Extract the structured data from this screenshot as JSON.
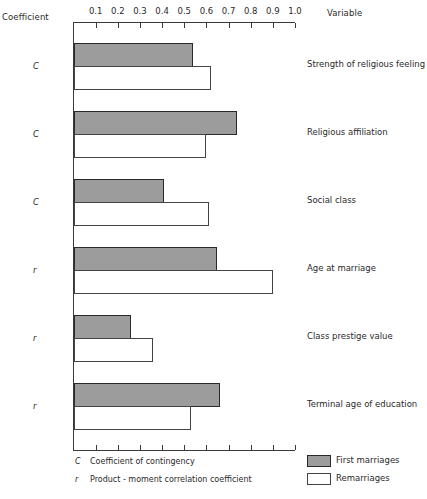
{
  "chart_data": {
    "type": "bar",
    "orientation": "horizontal",
    "title": "",
    "xlabel": "",
    "ylabel": "",
    "column_headers": {
      "left": "Coefficient",
      "right": "Variable"
    },
    "axis": {
      "min": 0,
      "max": 1.0,
      "ticks": [
        "0.1",
        "0.2",
        "0.3",
        "0.4",
        "0.5",
        "0.6",
        "0.7",
        "0.8",
        "0.9",
        "1.0"
      ],
      "position": "top and bottom"
    },
    "grid": false,
    "categories": [
      "Strength of religious feeling",
      "Religious affiliation",
      "Social class",
      "Age at marriage",
      "Class prestige value",
      "Terminal age of education"
    ],
    "coefficients": [
      "C",
      "C",
      "C",
      "r",
      "r",
      "r"
    ],
    "series": [
      {
        "name": "First marriages",
        "fill": "#9c9c9c",
        "values": [
          0.54,
          0.74,
          0.41,
          0.65,
          0.26,
          0.66
        ]
      },
      {
        "name": "Remarriages",
        "fill": "#ffffff",
        "values": [
          0.62,
          0.6,
          0.61,
          0.9,
          0.36,
          0.53
        ]
      }
    ],
    "legend": {
      "position": "bottom-right",
      "entries": [
        "First marriages",
        "Remarriages"
      ]
    },
    "notes": [
      {
        "symbol": "C",
        "text": "Coefficient of contingency"
      },
      {
        "symbol": "r",
        "text": "Product - moment correlation coefficient"
      }
    ]
  }
}
